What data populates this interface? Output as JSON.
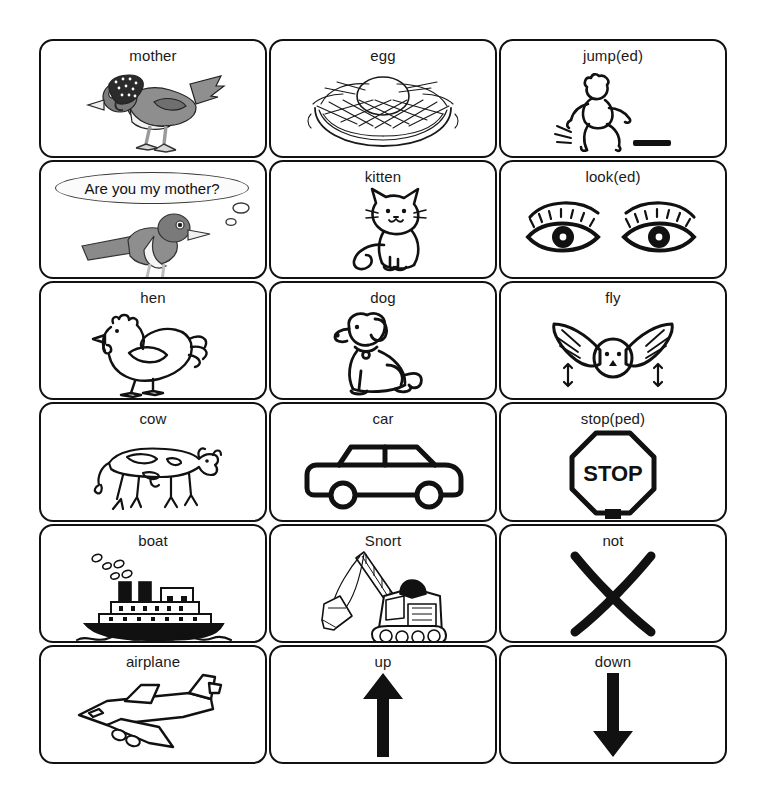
{
  "page": {
    "background_color": "#ffffff",
    "line_color": "#111111",
    "text_color": "#1a1a1a",
    "columns": 3,
    "rows": 6
  },
  "cards": [
    {
      "label": "mother",
      "icon": "bird-with-bonnet-icon",
      "row": 1,
      "col": 1
    },
    {
      "label": "egg",
      "icon": "egg-in-nest-icon",
      "row": 1,
      "col": 2
    },
    {
      "label": "jump(ed)",
      "icon": "jumping-person-icon",
      "row": 1,
      "col": 3
    },
    {
      "label": "kitten",
      "icon": "cat-icon",
      "row": 2,
      "col": 2
    },
    {
      "label": "look(ed)",
      "icon": "pair-of-eyes-icon",
      "row": 2,
      "col": 3
    },
    {
      "label": "hen",
      "icon": "hen-icon",
      "row": 3,
      "col": 1
    },
    {
      "label": "dog",
      "icon": "dog-icon",
      "row": 3,
      "col": 2
    },
    {
      "label": "fly",
      "icon": "flying-bird-icon",
      "row": 3,
      "col": 3
    },
    {
      "label": "cow",
      "icon": "cow-icon",
      "row": 4,
      "col": 1
    },
    {
      "label": "car",
      "icon": "car-icon",
      "row": 4,
      "col": 2
    },
    {
      "label": "stop(ped)",
      "icon": "stop-sign-icon",
      "row": 4,
      "col": 3
    },
    {
      "label": "boat",
      "icon": "steamship-icon",
      "row": 5,
      "col": 1
    },
    {
      "label": "Snort",
      "icon": "steam-shovel-icon",
      "row": 5,
      "col": 2
    },
    {
      "label": "not",
      "icon": "x-cross-icon",
      "row": 5,
      "col": 3
    },
    {
      "label": "airplane",
      "icon": "airplane-icon",
      "row": 6,
      "col": 1
    },
    {
      "label": "up",
      "icon": "up-arrow-icon",
      "row": 6,
      "col": 2
    },
    {
      "label": "down",
      "icon": "down-arrow-icon",
      "row": 6,
      "col": 3
    }
  ],
  "speech_card": {
    "bubble_text": "Are you my mother?",
    "icon": "baby-bird-icon",
    "row": 2,
    "col": 1
  }
}
